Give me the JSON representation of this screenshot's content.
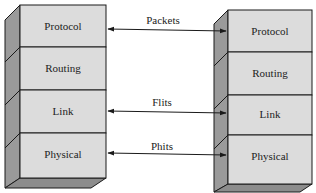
{
  "diagram": {
    "left_stack": {
      "layers": [
        {
          "label": "Protocol"
        },
        {
          "label": "Routing"
        },
        {
          "label": "Link"
        },
        {
          "label": "Physical"
        }
      ]
    },
    "right_stack": {
      "layers": [
        {
          "label": "Protocol"
        },
        {
          "label": "Routing"
        },
        {
          "label": "Link"
        },
        {
          "label": "Physical"
        }
      ]
    },
    "connections": [
      {
        "label": "Packets",
        "from": "Protocol",
        "to": "Protocol"
      },
      {
        "label": "Flits",
        "from": "Link",
        "to": "Link"
      },
      {
        "label": "Phits",
        "from": "Physical",
        "to": "Physical"
      }
    ],
    "colors": {
      "front_face": "#dcdcdc",
      "side_face": "#9a9a9a",
      "bottom_face": "#8c8c8c",
      "stroke": "#1a1a1a"
    }
  }
}
